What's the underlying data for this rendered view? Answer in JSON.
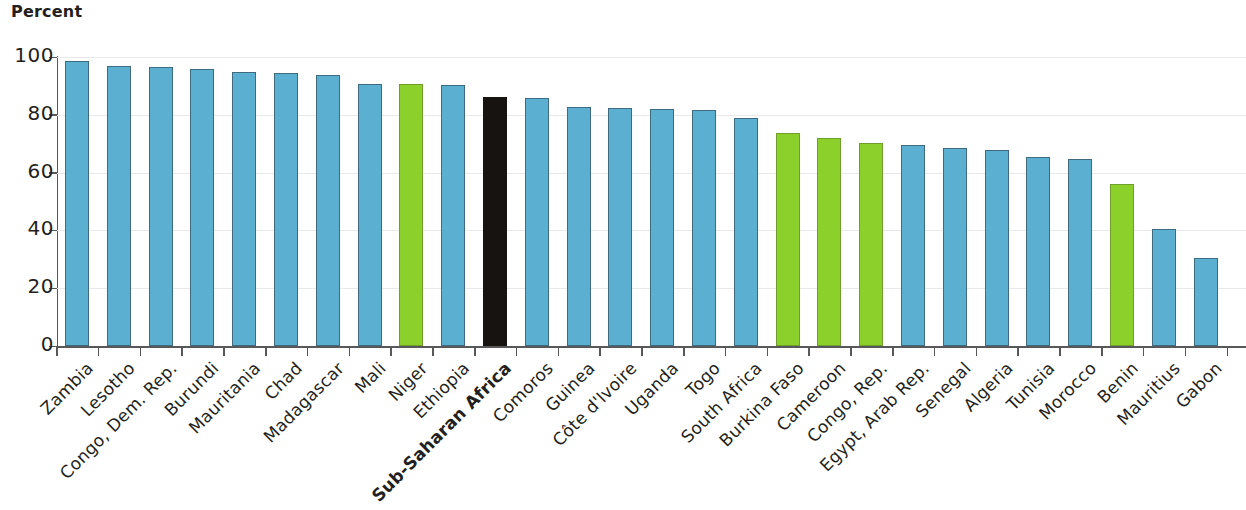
{
  "chart_data": {
    "type": "bar",
    "title": "Percent",
    "ylabel": "Percent",
    "xlabel": "",
    "ylim": [
      0,
      100
    ],
    "ytick_labels": [
      "0",
      "20",
      "40",
      "60",
      "80",
      "100"
    ],
    "ytick_values": [
      0,
      20,
      40,
      60,
      80,
      100
    ],
    "grid": true,
    "legend_position": "none",
    "colors": {
      "blue": "#5bafd0",
      "green": "#8cd02c",
      "black": "#171310",
      "gridline": "#e9e9ec",
      "axis": "#58585b",
      "text": "#231f20"
    },
    "categories": [
      "Zambia",
      "Lesotho",
      "Congo, Dem. Rep.",
      "Burundi",
      "Mauritania",
      "Chad",
      "Madagascar",
      "Mali",
      "Niger",
      "Ethiopia",
      "Sub-Saharan Africa",
      "Comoros",
      "Guinea",
      "Côte d'Ivoire",
      "Uganda",
      "Togo",
      "South Africa",
      "Burkina Faso",
      "Cameroon",
      "Congo, Rep.",
      "Egypt, Arab Rep.",
      "Senegal",
      "Algeria",
      "Tunisia",
      "Morocco",
      "Benin",
      "Mauritius",
      "Gabon"
    ],
    "values": [
      98.5,
      97.0,
      96.7,
      95.8,
      94.9,
      94.5,
      93.9,
      90.5,
      90.5,
      90.3,
      86.0,
      85.8,
      82.6,
      82.5,
      81.9,
      81.7,
      79.0,
      73.7,
      72.0,
      70.2,
      69.6,
      68.5,
      67.8,
      65.5,
      64.8,
      56.2,
      40.5,
      30.6
    ],
    "bar_colors": [
      "blue",
      "blue",
      "blue",
      "blue",
      "blue",
      "blue",
      "blue",
      "blue",
      "green",
      "blue",
      "black",
      "blue",
      "blue",
      "blue",
      "blue",
      "blue",
      "blue",
      "green",
      "green",
      "green",
      "blue",
      "blue",
      "blue",
      "blue",
      "blue",
      "green",
      "blue",
      "blue"
    ],
    "emphasized_categories": [
      "Sub-Saharan Africa"
    ]
  }
}
